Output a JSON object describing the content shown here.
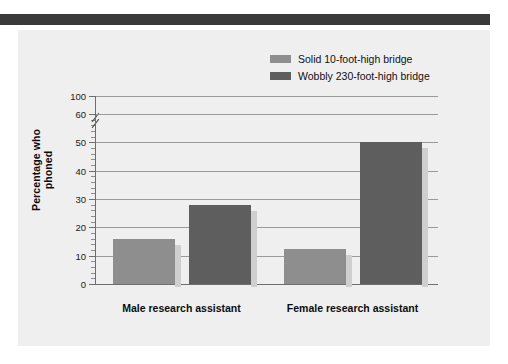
{
  "figure": {
    "background_color": "#efefef",
    "top_rule_color": "#3a3a3a"
  },
  "legend": {
    "position": "top-right",
    "items": [
      {
        "label": "Solid 10-foot-high bridge",
        "color": "#8e8e8e"
      },
      {
        "label": "Wobbly 230-foot-high bridge",
        "color": "#5e5e5e"
      }
    ]
  },
  "chart_data": {
    "type": "bar",
    "title": "",
    "xlabel": "",
    "ylabel": "Percentage who phoned",
    "categories": [
      "Male research assistant",
      "Female research assistant"
    ],
    "series": [
      {
        "name": "Solid 10-foot-high bridge",
        "color": "#8e8e8e",
        "values": [
          16,
          12.5
        ]
      },
      {
        "name": "Wobbly 230-foot-high bridge",
        "color": "#5e5e5e",
        "values": [
          28,
          50
        ]
      }
    ],
    "ylim": [
      0,
      60
    ],
    "axis_break": {
      "present": true,
      "between": [
        60,
        100
      ]
    },
    "ytick_labels": [
      "0",
      "10",
      "20",
      "30",
      "40",
      "50",
      "60",
      "100"
    ],
    "ytick_values": [
      0,
      10,
      20,
      30,
      40,
      50,
      60,
      100
    ],
    "yminor_step": 2,
    "grid": "horizontal",
    "legend_position": "top-right"
  }
}
